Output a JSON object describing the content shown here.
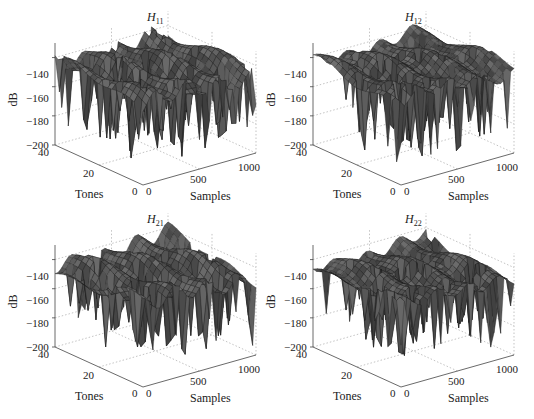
{
  "figure": {
    "layout": "2x2",
    "background": "#ffffff",
    "surface_color": "#3a3a3a",
    "mesh_color": "#1e1e1e",
    "grid_color": "#9a9a9a"
  },
  "chart_data": [
    {
      "type": "surface",
      "title": "H11",
      "title_main": "H",
      "title_sub": "11",
      "xlabel": "Samples",
      "ylabel": "Tones",
      "zlabel": "dB",
      "xlim": [
        0,
        1000
      ],
      "ylim": [
        0,
        40
      ],
      "zlim": [
        -200,
        -130
      ],
      "xticks": [
        "0",
        "500",
        "1000"
      ],
      "yticks": [
        "0",
        "20",
        "40"
      ],
      "zticks": [
        "-140",
        "-160",
        "-180",
        "-200"
      ],
      "grid": true,
      "description": "Channel frequency response magnitude; mean level about -145 dB with ridges along samples; deep fades down to about -195 dB near tones 0-20",
      "profile": {
        "mean": -145,
        "ridge_amp": 6,
        "fade_depth": 45,
        "seed": 11
      }
    },
    {
      "type": "surface",
      "title": "H12",
      "title_main": "H",
      "title_sub": "12",
      "xlabel": "Samples",
      "ylabel": "Tones",
      "zlabel": "dB",
      "xlim": [
        0,
        1000
      ],
      "ylim": [
        0,
        40
      ],
      "zlim": [
        -200,
        -130
      ],
      "xticks": [
        "0",
        "500",
        "1000"
      ],
      "yticks": [
        "0",
        "20",
        "40"
      ],
      "zticks": [
        "-140",
        "-160",
        "-180",
        "-200"
      ],
      "grid": true,
      "description": "Channel frequency response magnitude; level about -140 to -150 dB; deep fades to about -195 dB around samples 300-800 at low tones",
      "profile": {
        "mean": -143,
        "ridge_amp": 4,
        "fade_depth": 45,
        "seed": 12
      }
    },
    {
      "type": "surface",
      "title": "H21",
      "title_main": "H",
      "title_sub": "21",
      "xlabel": "Samples",
      "ylabel": "Tones",
      "zlabel": "dB",
      "xlim": [
        0,
        1000
      ],
      "ylim": [
        0,
        40
      ],
      "zlim": [
        -200,
        -130
      ],
      "xticks": [
        "0",
        "500",
        "1000"
      ],
      "yticks": [
        "0",
        "20",
        "40"
      ],
      "zticks": [
        "-140",
        "-160",
        "-180",
        "-200"
      ],
      "grid": true,
      "description": "Channel frequency response magnitude; mean about -145 dB with periodic ridges; fades down to about -195 dB",
      "profile": {
        "mean": -145,
        "ridge_amp": 6,
        "fade_depth": 42,
        "seed": 21
      }
    },
    {
      "type": "surface",
      "title": "H22",
      "title_main": "H",
      "title_sub": "22",
      "xlabel": "Samples",
      "ylabel": "Tones",
      "zlabel": "dB",
      "xlim": [
        0,
        1000
      ],
      "ylim": [
        0,
        40
      ],
      "zlim": [
        -200,
        -130
      ],
      "xticks": [
        "0",
        "500",
        "1000"
      ],
      "yticks": [
        "0",
        "20",
        "40"
      ],
      "zticks": [
        "-140",
        "-160",
        "-180",
        "-200"
      ],
      "grid": true,
      "description": "Channel frequency response magnitude; level about -145 dB; fades down to about -195 dB around samples 200-600",
      "profile": {
        "mean": -146,
        "ridge_amp": 4,
        "fade_depth": 42,
        "seed": 22
      }
    }
  ]
}
